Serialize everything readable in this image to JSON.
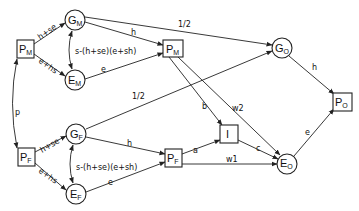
{
  "diagram": {
    "type": "path-diagram",
    "nodes": {
      "PM_left": {
        "main": "P",
        "sub": "M",
        "shape": "box"
      },
      "GM": {
        "main": "G",
        "sub": "M",
        "shape": "circle"
      },
      "EM": {
        "main": "E",
        "sub": "M",
        "shape": "circle"
      },
      "PM_mid": {
        "main": "P",
        "sub": "M",
        "shape": "box"
      },
      "GO": {
        "main": "G",
        "sub": "O",
        "shape": "circle"
      },
      "PO": {
        "main": "P",
        "sub": "O",
        "shape": "box"
      },
      "PF_left": {
        "main": "P",
        "sub": "F",
        "shape": "box"
      },
      "GF": {
        "main": "G",
        "sub": "F",
        "shape": "circle"
      },
      "EF": {
        "main": "E",
        "sub": "F",
        "shape": "circle"
      },
      "PF_mid": {
        "main": "P",
        "sub": "F",
        "shape": "box"
      },
      "I": {
        "main": "I",
        "sub": "",
        "shape": "box"
      },
      "EO": {
        "main": "E",
        "sub": "O",
        "shape": "circle"
      }
    },
    "edges": {
      "pm_gm": "h+se",
      "pm_em": "e+hs",
      "gm_em_corr": "s-(h+se)(e+sh)",
      "gm_pmmid": "h",
      "em_pmmid": "e",
      "gm_go": "1/2",
      "pm_pf_corr": "p",
      "pf_gf": "h+se",
      "pf_ef": "e+hs",
      "gf_ef_corr": "s-(h+se)(e+sh)",
      "gf_pfmid": "h",
      "ef_pfmid": "e",
      "gf_go": "1/2",
      "pmmid_i": "b",
      "pmmid_eo": "w2",
      "pfmid_i": "a",
      "pfmid_eo": "w1",
      "i_eo": "c",
      "go_po": "h",
      "eo_po": "e"
    }
  }
}
